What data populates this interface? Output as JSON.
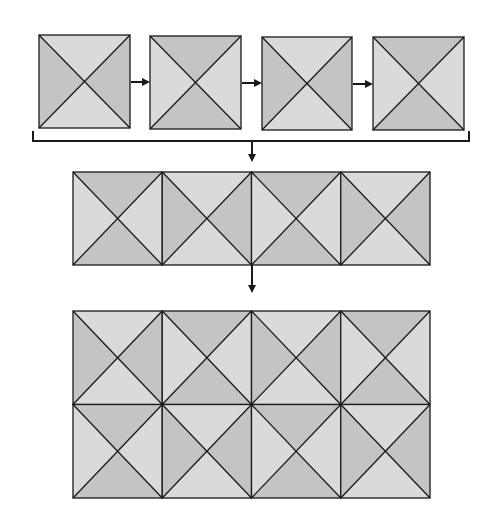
{
  "diagram": {
    "title": "",
    "colors": {
      "light": "#dadada",
      "dark": "#c4c4c4",
      "stroke": "#1a1a1a",
      "background": "#ffffff"
    },
    "patterns": {
      "A": {
        "top": "light",
        "bottom": "light",
        "left": "dark",
        "right": "dark"
      },
      "B": {
        "top": "dark",
        "bottom": "dark",
        "left": "light",
        "right": "light"
      }
    },
    "stage1": {
      "label": "Four separate tiles",
      "tiles": [
        {
          "x": 39,
          "y": 35,
          "w": 91,
          "h": 93,
          "pattern": "A"
        },
        {
          "x": 150,
          "y": 36,
          "w": 91,
          "h": 93,
          "pattern": "B"
        },
        {
          "x": 262,
          "y": 37,
          "w": 90,
          "h": 93,
          "pattern": "A"
        },
        {
          "x": 373,
          "y": 37,
          "w": 91,
          "h": 93,
          "pattern": "B"
        }
      ],
      "arrows": [
        {
          "x1": 131,
          "y1": 82,
          "x2": 148
        },
        {
          "x1": 242,
          "y1": 83,
          "x2": 260
        },
        {
          "x1": 353,
          "y1": 84,
          "x2": 371
        }
      ]
    },
    "bracket": {
      "x1": 33,
      "x2": 469,
      "top": 131,
      "bottom": 141
    },
    "arrow_down_1": {
      "x": 252,
      "y1": 141,
      "y2": 160
    },
    "stage2": {
      "label": "Single row of tiles",
      "x": 73,
      "y": 172,
      "w": 357,
      "h": 93,
      "cols": 4,
      "patterns": [
        "B",
        "A",
        "B",
        "A"
      ]
    },
    "arrow_down_2": {
      "x": 252,
      "y1": 265,
      "y2": 291
    },
    "stage3": {
      "label": "Tiled 2x4 grid",
      "x": 73,
      "y": 311,
      "w": 357,
      "h": 187,
      "cols": 4,
      "rows": 2,
      "patterns": [
        [
          "A",
          "B",
          "A",
          "B"
        ],
        [
          "B",
          "A",
          "B",
          "A"
        ]
      ]
    }
  }
}
